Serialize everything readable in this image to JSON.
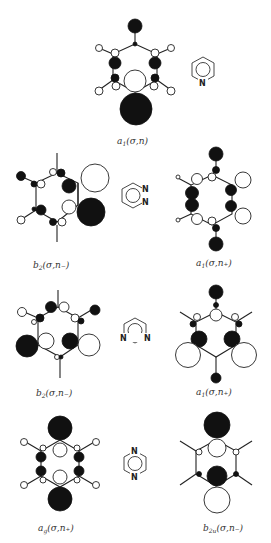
{
  "figure": {
    "colors": {
      "positive_lobe": "#111111",
      "negative_lobe": "#ffffff",
      "line": "#222222"
    }
  },
  "panels": [
    {
      "molecule": "pyridine",
      "label_main": "a",
      "label_sub": "1",
      "label_rest": "(σ,n)",
      "symmetry": "a1(σ,n)"
    },
    {
      "molecule": "pyridazine",
      "label_main": "b",
      "label_sub": "2",
      "label_rest": "(σ,n₋)",
      "symmetry": "b2(σ,n−)"
    },
    {
      "molecule": "pyridazine",
      "label_main": "a",
      "label_sub": "1",
      "label_rest": "(σ,n₊)",
      "symmetry": "a1(σ,n+)"
    },
    {
      "molecule": "pyrimidine",
      "label_main": "b",
      "label_sub": "2",
      "label_rest": "(σ,n₋)",
      "symmetry": "b2(σ,n−)"
    },
    {
      "molecule": "pyrimidine",
      "label_main": "a",
      "label_sub": "1",
      "label_rest": "(σ,n₊)",
      "symmetry": "a1(σ,n+)"
    },
    {
      "molecule": "pyrazine",
      "label_main": "a",
      "label_sub": "g",
      "label_rest": "(σ,n₊)",
      "symmetry": "ag(σ,n+)"
    },
    {
      "molecule": "pyrazine",
      "label_main": "b",
      "label_sub": "2u",
      "label_rest": "(σ,n₋)",
      "symmetry": "b2u(σ,n−)"
    }
  ],
  "structures": [
    {
      "name": "pyridine",
      "atoms": [
        "N"
      ]
    },
    {
      "name": "pyridazine",
      "atoms": [
        "N",
        "N"
      ]
    },
    {
      "name": "pyrimidine",
      "atoms": [
        "N",
        "N"
      ]
    },
    {
      "name": "pyrazine",
      "atoms": [
        "N",
        "N"
      ]
    }
  ]
}
